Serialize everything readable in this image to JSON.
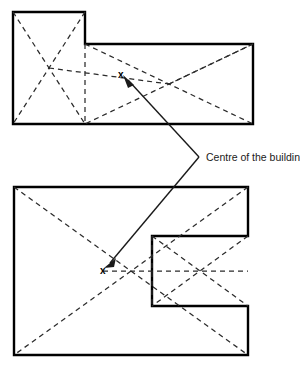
{
  "figure": {
    "type": "diagram",
    "background_color": "#ffffff",
    "outline_color": "#000000",
    "dash_color": "#2b2b2b",
    "leader_color": "#1a1a1a",
    "width": 300,
    "height": 368
  },
  "annotation": {
    "label": "Centre of the building",
    "label_x": 206,
    "label_y": 161,
    "vertex_x": 199,
    "vertex_y": 157,
    "arrow_upper_x": 124,
    "arrow_upper_y": 77,
    "arrow_lower_x": 105,
    "arrow_lower_y": 266
  },
  "shapes": [
    {
      "name": "upper-plan-l-shape",
      "marker": "x",
      "marker_x": 121,
      "marker_y": 74,
      "outline_points": "13,12 85,12 85,44 253,44 253,124 13,124",
      "dashed_lines": [
        {
          "name": "left-block-diagonal-a",
          "x1": 13,
          "y1": 12,
          "x2": 85,
          "y2": 124
        },
        {
          "name": "left-block-diagonal-b",
          "x1": 85,
          "y1": 12,
          "x2": 13,
          "y2": 124
        },
        {
          "name": "right-block-diagonal-a",
          "x1": 85,
          "y1": 44,
          "x2": 253,
          "y2": 124
        },
        {
          "name": "right-block-diagonal-b",
          "x1": 253,
          "y1": 44,
          "x2": 85,
          "y2": 124
        },
        {
          "name": "centroid-link-left",
          "x1": 49,
          "y1": 68,
          "x2": 169,
          "y2": 84
        },
        {
          "name": "centroid-link-right",
          "x1": 169,
          "y1": 84,
          "x2": 253,
          "y2": 44
        },
        {
          "name": "internal-step-edge",
          "x1": 85,
          "y1": 44,
          "x2": 85,
          "y2": 124
        }
      ]
    },
    {
      "name": "lower-plan-c-shape",
      "marker": "x",
      "marker_x": 103,
      "marker_y": 270,
      "outline_points": "14,187 248,187 248,236 152,236 152,306 248,306 248,355 14,355",
      "dashed_lines": [
        {
          "name": "outer-diagonal-a",
          "x1": 14,
          "y1": 187,
          "x2": 248,
          "y2": 355
        },
        {
          "name": "outer-diagonal-b",
          "x1": 248,
          "y1": 187,
          "x2": 14,
          "y2": 355
        },
        {
          "name": "notch-diagonal-a",
          "x1": 152,
          "y1": 236,
          "x2": 248,
          "y2": 306
        },
        {
          "name": "notch-diagonal-b",
          "x1": 248,
          "y1": 236,
          "x2": 152,
          "y2": 306
        },
        {
          "name": "centroid-horizontal",
          "x1": 103,
          "y1": 271,
          "x2": 248,
          "y2": 271
        },
        {
          "name": "internal-notch-edge",
          "x1": 152,
          "y1": 236,
          "x2": 152,
          "y2": 306
        }
      ]
    }
  ]
}
